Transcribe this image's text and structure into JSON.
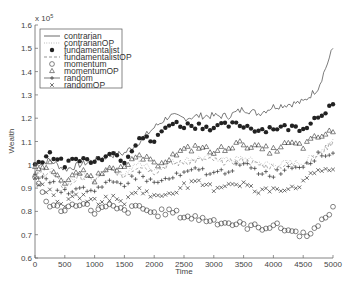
{
  "chart_data": {
    "type": "line",
    "title": "",
    "xlabel": "Time",
    "ylabel": "Wealth",
    "y_multiplier": "x 10^5",
    "y_multiplier_label": "x 10",
    "y_multiplier_exp": "5",
    "xlim": [
      0,
      5000
    ],
    "ylim": [
      0.6,
      1.6
    ],
    "xticks": [
      0,
      500,
      1000,
      1500,
      2000,
      2500,
      3000,
      3500,
      4000,
      4500,
      5000
    ],
    "yticks": [
      0.6,
      0.7,
      0.8,
      0.9,
      1.0,
      1.1,
      1.2,
      1.3,
      1.4,
      1.5,
      1.6
    ],
    "ytick_labels": [
      "0.6",
      "0.7",
      "0.8",
      "0.9",
      "1",
      "1.1",
      "1.2",
      "1.3",
      "1.4",
      "1.5",
      "1.6"
    ],
    "grid": false,
    "legend_position": "upper left",
    "x": [
      0,
      250,
      500,
      750,
      1000,
      1250,
      1500,
      1750,
      2000,
      2250,
      2500,
      2750,
      3000,
      3250,
      3500,
      3750,
      4000,
      4250,
      4500,
      4750,
      5000
    ],
    "series": [
      {
        "name": "contrarian",
        "marker": "line",
        "values": [
          1.0,
          1.02,
          0.98,
          1.0,
          1.02,
          1.04,
          1.05,
          1.1,
          1.16,
          1.21,
          1.2,
          1.21,
          1.21,
          1.21,
          1.24,
          1.22,
          1.25,
          1.26,
          1.27,
          1.33,
          1.5
        ]
      },
      {
        "name": "contrarianOP",
        "marker": "dotted",
        "values": [
          0.97,
          0.98,
          0.92,
          0.96,
          0.94,
          0.99,
          0.96,
          1.01,
          0.98,
          1.01,
          1.02,
          1.03,
          1.03,
          1.02,
          1.03,
          1.01,
          1.0,
          1.01,
          1.01,
          1.05,
          1.11
        ]
      },
      {
        "name": "fundamentalist",
        "marker": "filled-dot",
        "values": [
          1.0,
          1.05,
          1.0,
          1.03,
          1.01,
          1.06,
          1.02,
          1.12,
          1.1,
          1.18,
          1.17,
          1.17,
          1.16,
          1.17,
          1.17,
          1.15,
          1.16,
          1.16,
          1.16,
          1.21,
          1.26
        ]
      },
      {
        "name": "fundamentalistOP",
        "marker": "dashed",
        "values": [
          0.96,
          0.97,
          0.9,
          0.95,
          0.93,
          0.98,
          0.95,
          1.0,
          0.97,
          1.0,
          1.01,
          1.02,
          1.02,
          1.01,
          1.02,
          1.0,
          0.99,
          1.0,
          1.0,
          1.04,
          1.1
        ]
      },
      {
        "name": "momentum",
        "marker": "circle",
        "values": [
          0.95,
          0.82,
          0.81,
          0.84,
          0.8,
          0.82,
          0.8,
          0.82,
          0.79,
          0.8,
          0.78,
          0.77,
          0.76,
          0.75,
          0.74,
          0.73,
          0.74,
          0.72,
          0.7,
          0.73,
          0.82
        ]
      },
      {
        "name": "momentumOP",
        "marker": "triangle",
        "values": [
          0.98,
          1.0,
          0.92,
          0.97,
          0.94,
          1.0,
          0.98,
          1.04,
          1.0,
          1.03,
          1.06,
          1.08,
          1.05,
          1.08,
          1.09,
          1.07,
          1.06,
          1.09,
          1.08,
          1.12,
          1.14
        ]
      },
      {
        "name": "random",
        "marker": "plus",
        "values": [
          0.96,
          0.93,
          0.88,
          0.91,
          0.88,
          0.92,
          0.92,
          0.96,
          0.92,
          0.94,
          0.96,
          0.98,
          0.96,
          0.98,
          1.0,
          0.97,
          0.96,
          0.99,
          1.0,
          1.04,
          1.05
        ]
      },
      {
        "name": "randomOP",
        "marker": "x",
        "values": [
          0.94,
          0.88,
          0.83,
          0.87,
          0.84,
          0.86,
          0.84,
          0.9,
          0.86,
          0.88,
          0.91,
          0.92,
          0.9,
          0.92,
          0.92,
          0.88,
          0.9,
          0.9,
          0.92,
          0.98,
          0.98
        ]
      }
    ]
  },
  "colors": {
    "axis": "#666666",
    "line": "#444444",
    "marker": "#333333",
    "background": "#ffffff"
  }
}
